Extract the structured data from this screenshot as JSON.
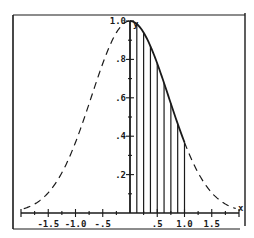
{
  "chart_data": {
    "type": "line",
    "title": "",
    "function": "y = e^(-x^2)",
    "xlabel": "x",
    "ylabel": "y",
    "xlim": [
      -2.0,
      2.0
    ],
    "ylim": [
      0,
      1.0
    ],
    "grid": false,
    "legend": null,
    "x_ticks": [
      {
        "value": -1.5,
        "label": "-1.5"
      },
      {
        "value": -1.0,
        "label": "-1.0"
      },
      {
        "value": -0.5,
        "label": "-.5"
      },
      {
        "value": 0.5,
        "label": ".5"
      },
      {
        "value": 1.0,
        "label": "1.0"
      },
      {
        "value": 1.5,
        "label": "1.5"
      }
    ],
    "x_minor_tick_step": 0.25,
    "y_ticks": [
      {
        "value": 0.2,
        "label": ".2"
      },
      {
        "value": 0.4,
        "label": ".4"
      },
      {
        "value": 0.6,
        "label": ".6"
      },
      {
        "value": 0.8,
        "label": ".8"
      },
      {
        "value": 1.0,
        "label": "1.0"
      }
    ],
    "y_minor_tick_step": 0.1,
    "series": [
      {
        "name": "curve (dashed, full domain)",
        "style": "dashed",
        "x": [
          -2.0,
          -1.75,
          -1.5,
          -1.25,
          -1.0,
          -0.75,
          -0.5,
          -0.25,
          0.0,
          0.25,
          0.5,
          0.75,
          1.0,
          1.25,
          1.5,
          1.75,
          2.0
        ],
        "y": [
          0.018,
          0.047,
          0.105,
          0.21,
          0.368,
          0.57,
          0.779,
          0.939,
          1.0,
          0.939,
          0.779,
          0.57,
          0.368,
          0.21,
          0.105,
          0.047,
          0.018
        ]
      },
      {
        "name": "curve (solid, 0 to 1)",
        "style": "solid",
        "x": [
          0.0,
          0.125,
          0.25,
          0.375,
          0.5,
          0.625,
          0.75,
          0.875,
          1.0
        ],
        "y": [
          1.0,
          0.984,
          0.939,
          0.869,
          0.779,
          0.677,
          0.57,
          0.465,
          0.368
        ]
      }
    ],
    "vertical_lines": {
      "description": "Vertical segments from x-axis up to the curve, shading area under curve from 0 to 1",
      "x": [
        0.0,
        0.125,
        0.25,
        0.375,
        0.5,
        0.625,
        0.75,
        0.875,
        1.0
      ],
      "heights": [
        1.0,
        0.984,
        0.939,
        0.869,
        0.779,
        0.677,
        0.57,
        0.465,
        0.368
      ]
    },
    "colors": {
      "ink": "#1a1a1a",
      "background": "#ffffff"
    }
  },
  "axes": {
    "x_label": "x",
    "y_label": "y"
  }
}
